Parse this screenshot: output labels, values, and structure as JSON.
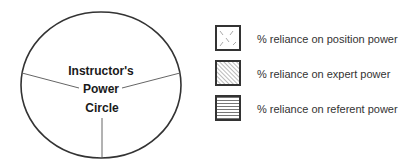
{
  "diagram": {
    "circle": {
      "title_lines": [
        "Instructor's",
        "Power",
        "Circle"
      ],
      "sections": 3
    },
    "legend": {
      "items": [
        {
          "label": "% reliance on position power",
          "pattern": "dashed-x-hatch"
        },
        {
          "label": "% reliance on expert power",
          "pattern": "diagonal-hatch"
        },
        {
          "label": "% reliance on referent power",
          "pattern": "horizontal-lines"
        }
      ]
    },
    "colors": {
      "stroke": "#333333",
      "divider": "#666666",
      "text": "#1a1a1a",
      "background": "#ffffff"
    }
  }
}
